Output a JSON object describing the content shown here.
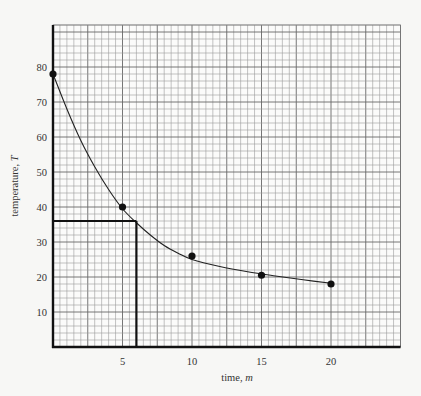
{
  "chart_data": {
    "type": "scatter",
    "title": "",
    "xlabel": "time, m",
    "xlabel_text": "time, ",
    "xlabel_var": "m",
    "ylabel": "temperature, T",
    "ylabel_text": "temperature, ",
    "ylabel_var": "T",
    "xlim": [
      0,
      25
    ],
    "ylim": [
      0,
      92
    ],
    "x_ticks": [
      5,
      10,
      15,
      20
    ],
    "y_ticks": [
      10,
      20,
      30,
      40,
      50,
      60,
      70,
      80
    ],
    "grid": true,
    "grid_minor_step": {
      "x": 0.5,
      "y": 2
    },
    "series": [
      {
        "name": "measurements",
        "x": [
          0,
          5,
          10,
          15,
          20
        ],
        "y": [
          78,
          40,
          26,
          20.5,
          18
        ]
      }
    ],
    "fit_curve": {
      "name": "smooth fit",
      "x": [
        0,
        1,
        2,
        3,
        4,
        5,
        6,
        7,
        8,
        9,
        10,
        12,
        14,
        16,
        18,
        20
      ],
      "y": [
        78,
        68,
        59,
        51.5,
        45,
        39.5,
        35.5,
        32,
        29,
        26.8,
        25,
        23,
        21.5,
        20.3,
        19.2,
        18.2
      ]
    },
    "annotations": [
      {
        "type": "reading",
        "x": 6,
        "y": 36,
        "description": "horizontal line from T=36 to curve, vertical line down to m=6"
      }
    ]
  }
}
